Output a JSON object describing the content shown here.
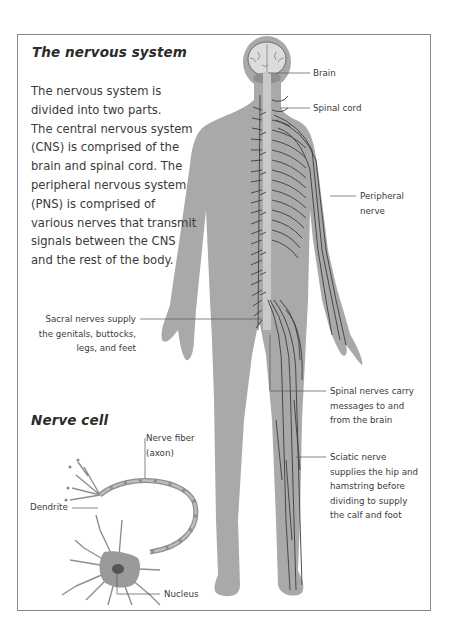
{
  "main": {
    "title": "The nervous system",
    "intro_lines": [
      "The nervous system is",
      "divided into two parts.",
      "The central nervous system",
      "(CNS) is comprised of the",
      "brain and spinal cord. The",
      "peripheral nervous system",
      "(PNS) is comprised of",
      "various nerves that transmit",
      "signals between the CNS",
      "and the rest of the body."
    ]
  },
  "body_labels": {
    "brain": "Brain",
    "spinal_cord": "Spinal cord",
    "peripheral_nerve": [
      "Peripheral",
      "nerve"
    ],
    "sacral_nerves": [
      "Sacral nerves supply",
      "the genitals, buttocks,",
      "legs, and feet"
    ],
    "spinal_nerves": [
      "Spinal nerves carry",
      "messages to and",
      "from the brain"
    ],
    "sciatic_nerve": [
      "Sciatic nerve",
      "supplies the hip and",
      "hamstring before",
      "dividing to supply",
      "the calf and foot"
    ]
  },
  "nerve_cell": {
    "title": "Nerve cell",
    "labels": {
      "nerve_fiber": [
        "Nerve fiber",
        "(axon)"
      ],
      "dendrite": "Dendrite",
      "nucleus": "Nucleus"
    }
  },
  "colors": {
    "body_fill": "#a9a9a9",
    "nerve_line": "#3c3c3c",
    "brain_fill": "#dcdcdc",
    "frame_border": "#8a8a8a",
    "text": "#3a3a3a"
  }
}
